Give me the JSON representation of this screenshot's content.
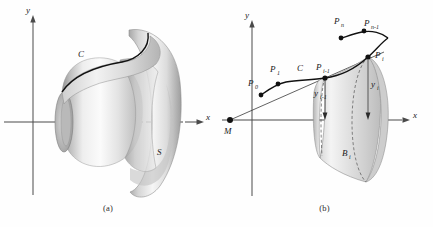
{
  "figure": {
    "type": "math-textbook-figure",
    "captions": {
      "a": "(a)",
      "b": "(b)"
    }
  },
  "panel_a": {
    "caption": "(a)",
    "axes": {
      "x_label": "x",
      "y_label": "y"
    },
    "labels": {
      "curve": "C",
      "surface": "S"
    }
  },
  "panel_b": {
    "caption": "(b)",
    "axes": {
      "x_label": "x",
      "y_label": "y"
    },
    "labels": {
      "origin_point": "M",
      "curve": "C",
      "p0": "P",
      "p0_sub": "0",
      "p1": "P",
      "p1_sub": "1",
      "pi_minus_1": "P",
      "pi_minus_1_sub": "i-1",
      "pi": "P",
      "pi_sub": "i",
      "pn_minus_1": "P",
      "pn_minus_1_sub": "n-1",
      "pn": "P",
      "pn_sub": "n",
      "y_i_minus_1": "y",
      "y_i_minus_1_sub": "i-1",
      "y_i": "y",
      "y_i_sub": "i",
      "band": "B",
      "band_sub": "i"
    }
  },
  "colors": {
    "background": "#fefefe",
    "axis": "#4a4a4a",
    "curve": "#111111",
    "label": "#1a1a1a",
    "surface_light": "#f2f2f2",
    "surface_mid": "#cfcfcf",
    "surface_dark": "#9a9a9a"
  }
}
